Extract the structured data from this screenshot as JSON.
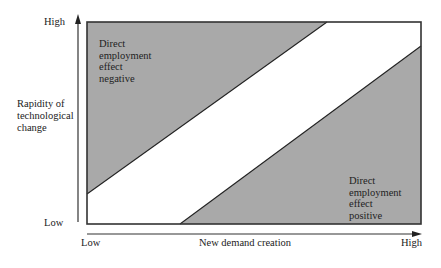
{
  "diagram": {
    "type": "region-diagram",
    "y_axis": {
      "title": "Rapidity of\ntechnological\nchange",
      "high_label": "High",
      "low_label": "Low"
    },
    "x_axis": {
      "title": "New demand creation",
      "low_label": "Low",
      "high_label": "High"
    },
    "regions": [
      {
        "id": "upper-left",
        "label": "Direct\nemployment\neffect\nnegative",
        "fill": "#a9a9a9"
      },
      {
        "id": "middle-band",
        "label": "",
        "fill": "#ffffff"
      },
      {
        "id": "lower-right",
        "label": "Direct\nemployment\neffect\npositive",
        "fill": "#a9a9a9"
      }
    ],
    "boundaries": [
      {
        "from": "left-edge at ~5% height",
        "to": "top-edge at ~72% width"
      },
      {
        "from": "bottom-edge at ~28% width",
        "to": "right-edge at ~88% height"
      }
    ],
    "colors": {
      "shade": "#a9a9a9",
      "line": "#222222",
      "background": "#ffffff"
    }
  }
}
